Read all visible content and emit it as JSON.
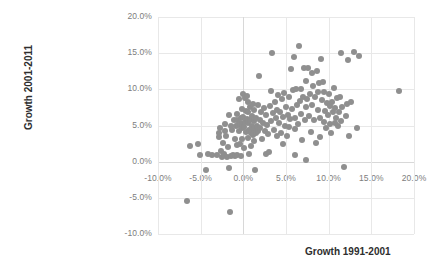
{
  "chart_data": {
    "type": "scatter",
    "title": "",
    "xlabel": "Growth 1991-2001",
    "ylabel": "Growth 2001-2011",
    "xlim": [
      -10,
      20
    ],
    "ylim": [
      -10,
      20
    ],
    "grid": true,
    "legend": false,
    "marker_color": "#8f8f8f",
    "marker_size_px": 6,
    "unit": "percent",
    "xticks": [
      "-10.0%",
      "-5.0%",
      "0.0%",
      "5.0%",
      "10.0%",
      "15.0%",
      "20.0%"
    ],
    "xtick_values": [
      -10,
      -5,
      0,
      5,
      10,
      15,
      20
    ],
    "yticks": [
      "-10.0%",
      "-5.0%",
      "0.0%",
      "5.0%",
      "10.0%",
      "15.0%",
      "20.0%"
    ],
    "ytick_values": [
      -10,
      -5,
      0,
      5,
      10,
      15,
      20
    ],
    "series": [
      {
        "name": "Districts",
        "points": [
          [
            -6.6,
            -5.5
          ],
          [
            -6.3,
            2.1
          ],
          [
            -5.3,
            2.5
          ],
          [
            -5.1,
            0.9
          ],
          [
            -4.4,
            -1.1
          ],
          [
            -4.1,
            1.0
          ],
          [
            -3.7,
            0.9
          ],
          [
            -3.1,
            0.9
          ],
          [
            -2.9,
            3.9
          ],
          [
            -2.8,
            3.4
          ],
          [
            -2.7,
            4.6
          ],
          [
            -2.6,
            1.5
          ],
          [
            -2.5,
            0.7
          ],
          [
            -2.4,
            2.6
          ],
          [
            -2.3,
            1.1
          ],
          [
            -2.2,
            5.2
          ],
          [
            -2.1,
            4.2
          ],
          [
            -2.0,
            3.6
          ],
          [
            -1.9,
            0.7
          ],
          [
            -1.8,
            2.0
          ],
          [
            -1.7,
            6.4
          ],
          [
            -1.7,
            -0.9
          ],
          [
            -1.6,
            -7.0
          ],
          [
            -1.5,
            5.0
          ],
          [
            -1.4,
            0.8
          ],
          [
            -1.3,
            4.4
          ],
          [
            -1.2,
            0.9
          ],
          [
            -1.1,
            5.7
          ],
          [
            -1.0,
            3.2
          ],
          [
            -1.0,
            0.8
          ],
          [
            -0.9,
            4.9
          ],
          [
            -0.8,
            5.8
          ],
          [
            -0.8,
            2.3
          ],
          [
            -0.7,
            6.6
          ],
          [
            -0.7,
            0.9
          ],
          [
            -0.6,
            5.1
          ],
          [
            -0.5,
            8.6
          ],
          [
            -0.5,
            4.3
          ],
          [
            -0.4,
            5.4
          ],
          [
            -0.4,
            2.5
          ],
          [
            -0.3,
            6.0
          ],
          [
            -0.3,
            0.8
          ],
          [
            -0.2,
            7.3
          ],
          [
            -0.2,
            4.6
          ],
          [
            -0.1,
            5.2
          ],
          [
            -0.1,
            3.2
          ],
          [
            0.0,
            9.4
          ],
          [
            0.0,
            6.2
          ],
          [
            0.1,
            4.8
          ],
          [
            0.1,
            1.9
          ],
          [
            0.2,
            8.8
          ],
          [
            0.2,
            5.5
          ],
          [
            0.3,
            7.0
          ],
          [
            0.3,
            4.1
          ],
          [
            0.4,
            9.1
          ],
          [
            0.4,
            5.9
          ],
          [
            0.5,
            6.8
          ],
          [
            0.5,
            3.3
          ],
          [
            0.6,
            8.2
          ],
          [
            0.6,
            5.3
          ],
          [
            0.7,
            4.4
          ],
          [
            0.7,
            1.0
          ],
          [
            0.8,
            7.6
          ],
          [
            0.8,
            5.7
          ],
          [
            0.9,
            4.0
          ],
          [
            0.9,
            2.2
          ],
          [
            1.0,
            6.3
          ],
          [
            1.0,
            4.9
          ],
          [
            1.1,
            8.0
          ],
          [
            1.1,
            3.7
          ],
          [
            1.2,
            5.6
          ],
          [
            1.2,
            2.8
          ],
          [
            1.3,
            7.2
          ],
          [
            1.3,
            4.5
          ],
          [
            1.4,
            -1.2
          ],
          [
            1.5,
            6.1
          ],
          [
            1.5,
            3.9
          ],
          [
            1.6,
            5.0
          ],
          [
            1.7,
            7.9
          ],
          [
            1.7,
            4.2
          ],
          [
            1.8,
            11.9
          ],
          [
            1.9,
            5.8
          ],
          [
            2.0,
            4.7
          ],
          [
            2.1,
            6.9
          ],
          [
            2.2,
            3.1
          ],
          [
            2.3,
            5.4
          ],
          [
            2.4,
            7.4
          ],
          [
            2.5,
            4.3
          ],
          [
            2.6,
            1.1
          ],
          [
            2.7,
            6.5
          ],
          [
            2.8,
            5.1
          ],
          [
            2.9,
            3.8
          ],
          [
            3.0,
            1.3
          ],
          [
            3.1,
            7.7
          ],
          [
            3.2,
            9.8
          ],
          [
            3.3,
            5.6
          ],
          [
            3.4,
            15.0
          ],
          [
            3.5,
            6.7
          ],
          [
            3.6,
            4.4
          ],
          [
            3.7,
            8.3
          ],
          [
            3.8,
            6.0
          ],
          [
            3.9,
            3.5
          ],
          [
            4.0,
            7.1
          ],
          [
            4.1,
            9.2
          ],
          [
            4.2,
            5.3
          ],
          [
            4.3,
            6.8
          ],
          [
            4.4,
            4.0
          ],
          [
            4.5,
            8.6
          ],
          [
            4.6,
            2.4
          ],
          [
            4.7,
            6.2
          ],
          [
            4.8,
            9.5
          ],
          [
            4.9,
            5.0
          ],
          [
            5.0,
            7.5
          ],
          [
            5.1,
            3.6
          ],
          [
            5.2,
            6.4
          ],
          [
            5.3,
            8.9
          ],
          [
            5.4,
            4.8
          ],
          [
            5.5,
            5.9
          ],
          [
            5.6,
            12.8
          ],
          [
            5.7,
            7.3
          ],
          [
            5.8,
            9.9
          ],
          [
            5.9,
            14.5
          ],
          [
            6.0,
            6.1
          ],
          [
            6.0,
            0.9
          ],
          [
            6.1,
            4.5
          ],
          [
            6.2,
            10.1
          ],
          [
            6.3,
            7.8
          ],
          [
            6.4,
            5.2
          ],
          [
            6.5,
            16.0
          ],
          [
            6.6,
            8.4
          ],
          [
            6.7,
            10.0
          ],
          [
            6.8,
            6.6
          ],
          [
            6.9,
            3.0
          ],
          [
            7.0,
            9.0
          ],
          [
            7.1,
            12.9
          ],
          [
            7.2,
            5.7
          ],
          [
            7.3,
            7.6
          ],
          [
            7.3,
            0.2
          ],
          [
            7.4,
            11.1
          ],
          [
            7.5,
            8.7
          ],
          [
            7.6,
            13.0
          ],
          [
            7.7,
            6.3
          ],
          [
            7.8,
            9.3
          ],
          [
            7.9,
            4.1
          ],
          [
            8.0,
            12.3
          ],
          [
            8.1,
            7.9
          ],
          [
            8.2,
            10.4
          ],
          [
            8.3,
            5.8
          ],
          [
            8.4,
            8.9
          ],
          [
            8.5,
            2.6
          ],
          [
            8.6,
            12.5
          ],
          [
            8.7,
            9.6
          ],
          [
            8.8,
            7.2
          ],
          [
            8.9,
            10.9
          ],
          [
            9.0,
            6.0
          ],
          [
            9.0,
            3.4
          ],
          [
            9.1,
            14.2
          ],
          [
            9.2,
            8.5
          ],
          [
            9.3,
            11.0
          ],
          [
            9.4,
            5.5
          ],
          [
            9.5,
            9.7
          ],
          [
            9.6,
            7.0
          ],
          [
            9.7,
            4.6
          ],
          [
            9.8,
            8.1
          ],
          [
            9.9,
            6.5
          ],
          [
            10.0,
            9.4
          ],
          [
            10.1,
            5.2
          ],
          [
            10.2,
            7.7
          ],
          [
            10.3,
            3.9
          ],
          [
            10.4,
            8.3
          ],
          [
            10.5,
            6.8
          ],
          [
            10.6,
            10.2
          ],
          [
            10.7,
            5.4
          ],
          [
            10.8,
            7.4
          ],
          [
            10.9,
            6.1
          ],
          [
            11.0,
            8.8
          ],
          [
            11.1,
            4.9
          ],
          [
            11.2,
            6.9
          ],
          [
            11.3,
            9.0
          ],
          [
            11.4,
            15.0
          ],
          [
            11.5,
            5.6
          ],
          [
            11.6,
            7.5
          ],
          [
            11.8,
            -0.7
          ],
          [
            12.0,
            6.3
          ],
          [
            12.2,
            8.0
          ],
          [
            12.3,
            14.1
          ],
          [
            12.4,
            3.5
          ],
          [
            12.6,
            8.2
          ],
          [
            13.0,
            15.2
          ],
          [
            13.3,
            4.7
          ],
          [
            13.5,
            14.6
          ],
          [
            18.2,
            9.8
          ]
        ]
      }
    ]
  },
  "axis_titles": {
    "x": "Growth 1991-2001",
    "y": "Growth 2001-2011"
  }
}
